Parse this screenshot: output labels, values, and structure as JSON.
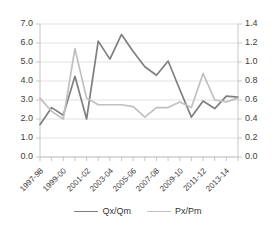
{
  "chart_data": {
    "type": "line",
    "title": "",
    "xlabel": "",
    "ylabel": "",
    "y2label": "",
    "grid": true,
    "legend_position": "bottom",
    "ylim": [
      0.0,
      7.0
    ],
    "ytick_step": 1.0,
    "y2lim": [
      0.0,
      1.4
    ],
    "y2tick_step": 0.2,
    "ytick_labels": [
      "0.0",
      "1.0",
      "2.0",
      "3.0",
      "4.0",
      "5.0",
      "6.0",
      "7.0"
    ],
    "y2tick_labels": [
      "0.0",
      "0.2",
      "0.4",
      "0.6",
      "0.8",
      "1.0",
      "1.2",
      "1.4"
    ],
    "x": [
      "1997-98",
      "1998-99",
      "1999-00",
      "2000-01",
      "2001-02",
      "2002-03",
      "2003-04",
      "2004-05",
      "2005-06",
      "2006-07",
      "2007-08",
      "2008-09",
      "2009-10",
      "2010-11",
      "2011-12",
      "2012-13",
      "2013-14",
      "2014-15"
    ],
    "xtick_labels": [
      "1997-98",
      "1999-00",
      "2001-02",
      "2003-04",
      "2005-06",
      "2007-08",
      "2009-10",
      "2011-12",
      "2013-14"
    ],
    "xtick_label_interval": 2,
    "series": [
      {
        "name": "Qx/Qm",
        "axis": "left",
        "color": "#7f7f7f",
        "values": [
          1.7,
          2.6,
          2.2,
          4.25,
          2.0,
          6.1,
          5.15,
          6.45,
          5.55,
          4.75,
          4.3,
          5.05,
          3.55,
          2.1,
          2.95,
          2.55,
          3.2,
          3.15
        ]
      },
      {
        "name": "Px/Pm",
        "axis": "right",
        "color": "#c0c0c0",
        "values": [
          0.62,
          0.48,
          0.4,
          1.14,
          0.62,
          0.55,
          0.55,
          0.55,
          0.53,
          0.42,
          0.52,
          0.52,
          0.58,
          0.52,
          0.88,
          0.6,
          0.58,
          0.62
        ]
      }
    ]
  },
  "legend": {
    "items": [
      {
        "label": "Qx/Qm",
        "color": "#7f7f7f"
      },
      {
        "label": "Px/Pm",
        "color": "#c0c0c0"
      }
    ]
  }
}
